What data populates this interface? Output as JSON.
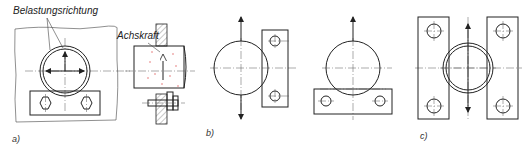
{
  "figure": {
    "annotations": {
      "load_direction": "Belastungsrichtung",
      "axial_force": "Achskraft"
    },
    "panels": [
      {
        "id": "a",
        "label": "a)"
      },
      {
        "id": "b",
        "label": "b)"
      },
      {
        "id": "c",
        "label": "c)"
      }
    ],
    "colors": {
      "line": "#222222",
      "centerline": "#555555",
      "red_marks": "#dd5555"
    }
  }
}
